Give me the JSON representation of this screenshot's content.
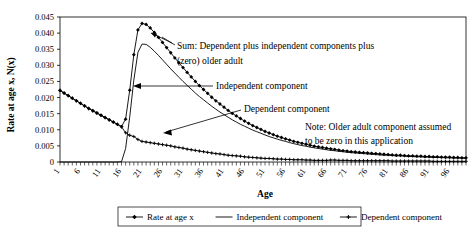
{
  "chart_data": {
    "type": "line",
    "title": "",
    "xlabel": "Age",
    "ylabel": "Rate at age x, N(x)",
    "xlim": [
      1,
      100
    ],
    "ylim": [
      0,
      0.045
    ],
    "grid": false,
    "legend_position": "bottom",
    "y_ticks": [
      "0",
      "0.005",
      "0.010",
      "0.015",
      "0.020",
      "0.025",
      "0.030",
      "0.035",
      "0.040",
      "0.045"
    ],
    "y_tick_values": [
      0,
      0.005,
      0.01,
      0.015,
      0.02,
      0.025,
      0.03,
      0.035,
      0.04,
      0.045
    ],
    "x_ticks": [
      "1",
      "6",
      "11",
      "16",
      "21",
      "26",
      "31",
      "36",
      "41",
      "46",
      "51",
      "56",
      "61",
      "66",
      "71",
      "76",
      "81",
      "86",
      "91",
      "96"
    ],
    "x_tick_values": [
      1,
      6,
      11,
      16,
      21,
      26,
      31,
      36,
      41,
      46,
      51,
      56,
      61,
      66,
      71,
      76,
      81,
      86,
      91,
      96
    ],
    "x": [
      1,
      2,
      3,
      4,
      5,
      6,
      7,
      8,
      9,
      10,
      11,
      12,
      13,
      14,
      15,
      16,
      17,
      18,
      19,
      20,
      21,
      22,
      23,
      24,
      25,
      26,
      27,
      28,
      29,
      30,
      31,
      32,
      33,
      34,
      35,
      36,
      37,
      38,
      39,
      40,
      41,
      42,
      43,
      44,
      45,
      46,
      47,
      48,
      49,
      50,
      51,
      52,
      53,
      54,
      55,
      56,
      57,
      58,
      59,
      60,
      61,
      62,
      63,
      64,
      65,
      66,
      67,
      68,
      69,
      70,
      71,
      72,
      73,
      74,
      75,
      76,
      77,
      78,
      79,
      80,
      81,
      82,
      83,
      84,
      85,
      86,
      87,
      88,
      89,
      90,
      91,
      92,
      93,
      94,
      95,
      96,
      97,
      98,
      99,
      100
    ],
    "series": [
      {
        "name": "Rate at age x",
        "marker": "diamond",
        "values": [
          0.0222,
          0.0214,
          0.0206,
          0.0198,
          0.019,
          0.0182,
          0.0174,
          0.0166,
          0.0159,
          0.0152,
          0.0145,
          0.0138,
          0.0131,
          0.0124,
          0.0117,
          0.011,
          0.0133,
          0.0223,
          0.0333,
          0.041,
          0.043,
          0.0427,
          0.0416,
          0.0402,
          0.0387,
          0.0371,
          0.0355,
          0.0339,
          0.0323,
          0.0308,
          0.0293,
          0.0278,
          0.0264,
          0.025,
          0.0237,
          0.0225,
          0.0213,
          0.0201,
          0.019,
          0.018,
          0.017,
          0.016,
          0.0151,
          0.0143,
          0.0135,
          0.0127,
          0.012,
          0.0113,
          0.0107,
          0.0101,
          0.0095,
          0.009,
          0.0085,
          0.008,
          0.0076,
          0.0072,
          0.0068,
          0.0064,
          0.0061,
          0.0058,
          0.0055,
          0.0052,
          0.0049,
          0.0047,
          0.0045,
          0.0043,
          0.0041,
          0.0039,
          0.0037,
          0.0035,
          0.0034,
          0.0032,
          0.0031,
          0.003,
          0.0029,
          0.0028,
          0.0027,
          0.0026,
          0.0025,
          0.0024,
          0.0023,
          0.0022,
          0.0021,
          0.0021,
          0.002,
          0.0019,
          0.0019,
          0.0018,
          0.0018,
          0.0017,
          0.0017,
          0.0016,
          0.0016,
          0.0015,
          0.0015,
          0.0015,
          0.0014,
          0.0014,
          0.0013,
          0.0013
        ]
      },
      {
        "name": "Independent component",
        "marker": "none",
        "values": [
          0,
          0,
          0,
          0,
          0,
          0,
          0,
          0,
          0,
          0,
          0,
          0,
          0,
          0,
          0,
          0.0001,
          0.0042,
          0.014,
          0.0254,
          0.034,
          0.0366,
          0.0365,
          0.0356,
          0.0344,
          0.0331,
          0.0317,
          0.0303,
          0.0289,
          0.0276,
          0.0263,
          0.025,
          0.0238,
          0.0226,
          0.0214,
          0.0203,
          0.0193,
          0.0183,
          0.0173,
          0.0164,
          0.0155,
          0.0147,
          0.0139,
          0.0131,
          0.0124,
          0.0117,
          0.0111,
          0.0105,
          0.0099,
          0.0094,
          0.0089,
          0.0084,
          0.0079,
          0.0075,
          0.0071,
          0.0067,
          0.0064,
          0.006,
          0.0057,
          0.0054,
          0.0051,
          0.0049,
          0.0046,
          0.0044,
          0.0042,
          0.004,
          0.0038,
          0.0036,
          0.0035,
          0.0033,
          0.0032,
          0.003,
          0.0029,
          0.0028,
          0.0027,
          0.0026,
          0.0025,
          0.0024,
          0.0023,
          0.0022,
          0.0021,
          0.0021,
          0.002,
          0.0019,
          0.0019,
          0.0018,
          0.0017,
          0.0017,
          0.0016,
          0.0016,
          0.0015,
          0.0015,
          0.0014,
          0.0014,
          0.0014,
          0.0013,
          0.0013,
          0.0012,
          0.0012,
          0.0012,
          0.0011
        ]
      },
      {
        "name": "Dependent component",
        "marker": "plus",
        "values": [
          0.0222,
          0.0214,
          0.0206,
          0.0198,
          0.019,
          0.0182,
          0.0174,
          0.0166,
          0.0159,
          0.0152,
          0.0145,
          0.0138,
          0.0131,
          0.0124,
          0.0117,
          0.0109,
          0.0091,
          0.0083,
          0.0079,
          0.007,
          0.0064,
          0.0062,
          0.006,
          0.0058,
          0.0056,
          0.0054,
          0.0052,
          0.005,
          0.0047,
          0.0045,
          0.0043,
          0.004,
          0.0038,
          0.0036,
          0.0034,
          0.0032,
          0.003,
          0.0028,
          0.0026,
          0.0025,
          0.0023,
          0.0021,
          0.002,
          0.0019,
          0.0018,
          0.0016,
          0.0015,
          0.0014,
          0.0013,
          0.0012,
          0.0011,
          0.0011,
          0.001,
          0.0009,
          0.0009,
          0.0008,
          0.0008,
          0.0007,
          0.0007,
          0.0007,
          0.0006,
          0.0006,
          0.0005,
          0.0005,
          0.0005,
          0.0005,
          0.0006,
          0.0006,
          0.0005,
          0.0005,
          0.0005,
          0.0004,
          0.0004,
          0.0004,
          0.0004,
          0.0004,
          0.0004,
          0.0004,
          0.0004,
          0.0004,
          0.0004,
          0.0003,
          0.0003,
          0.0003,
          0.0003,
          0.0003,
          0.0003,
          0.0003,
          0.0003,
          0.0003,
          0.0003,
          0.0002,
          0.0002,
          0.0002,
          0.0002,
          0.0002,
          0.0002,
          0.0002,
          0.0002,
          0.0002
        ]
      }
    ],
    "annotations": [
      {
        "name": "sum-annotation",
        "line1": "Sum: Dependent plus independent components plus",
        "line2": "(zero) older adult"
      },
      {
        "name": "independent-annotation",
        "text": "Independent component"
      },
      {
        "name": "dependent-annotation",
        "text": "Dependent component"
      },
      {
        "name": "note-annotation",
        "line1": "Note: Older adult component assumed",
        "line2": "to be zero in this application"
      }
    ]
  },
  "legend": {
    "items": [
      {
        "label": "Rate at age x"
      },
      {
        "label": "Independent component"
      },
      {
        "label": "Dependent component"
      }
    ]
  },
  "colors": {
    "line": "#000000",
    "axis": "#000000",
    "background": "#ffffff"
  }
}
